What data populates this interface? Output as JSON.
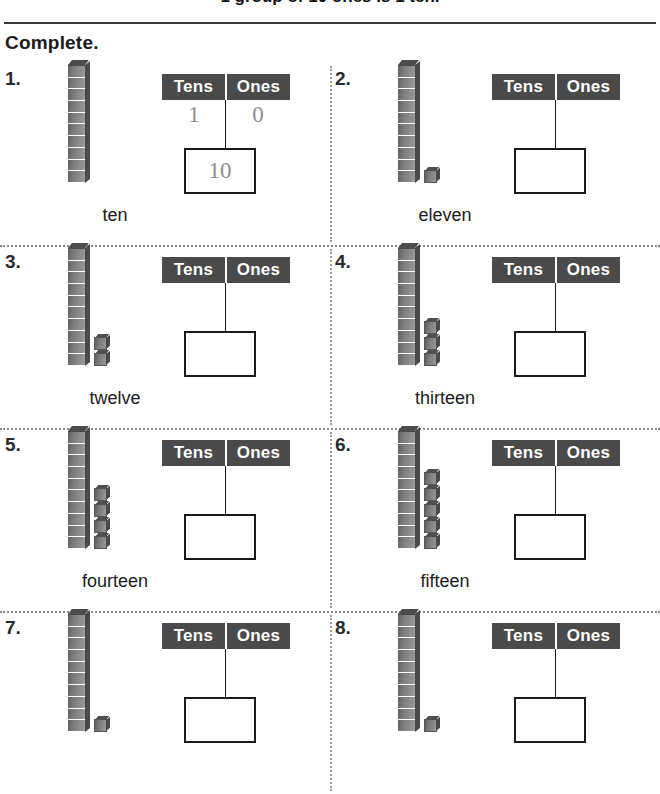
{
  "banner": {
    "text": "1 group of 10 ones is 1 ten."
  },
  "directive": {
    "label": "Complete."
  },
  "chart_headers": {
    "tens": "Tens",
    "ones": "Ones"
  },
  "problems": [
    {
      "number": "1.",
      "word": "ten",
      "rods": 1,
      "units": 0,
      "tens_digit": "1",
      "ones_digit": "0",
      "answer": "10"
    },
    {
      "number": "2.",
      "word": "eleven",
      "rods": 1,
      "units": 1,
      "tens_digit": "",
      "ones_digit": "",
      "answer": ""
    },
    {
      "number": "3.",
      "word": "twelve",
      "rods": 1,
      "units": 2,
      "tens_digit": "",
      "ones_digit": "",
      "answer": ""
    },
    {
      "number": "4.",
      "word": "thirteen",
      "rods": 1,
      "units": 3,
      "tens_digit": "",
      "ones_digit": "",
      "answer": ""
    },
    {
      "number": "5.",
      "word": "fourteen",
      "rods": 1,
      "units": 4,
      "tens_digit": "",
      "ones_digit": "",
      "answer": ""
    },
    {
      "number": "6.",
      "word": "fifteen",
      "rods": 1,
      "units": 5,
      "tens_digit": "",
      "ones_digit": "",
      "answer": ""
    },
    {
      "number": "7.",
      "word": "",
      "rods": 1,
      "units": 1,
      "tens_digit": "",
      "ones_digit": "",
      "answer": ""
    },
    {
      "number": "8.",
      "word": "",
      "rods": 1,
      "units": 1,
      "tens_digit": "",
      "ones_digit": "",
      "answer": ""
    }
  ]
}
